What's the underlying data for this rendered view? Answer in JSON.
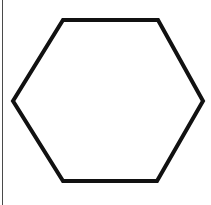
{
  "canvas": {
    "background": "#ffffff",
    "left_border_color": "#4a4a4a"
  },
  "hexagon": {
    "points": "63,20 158,20 203,101 157,181 63,181 13,101",
    "stroke": "#111111",
    "fill": "#ffffff",
    "stroke_width": "4"
  }
}
